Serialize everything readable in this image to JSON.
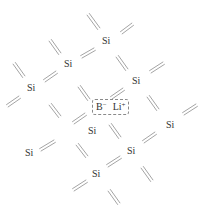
{
  "diagram": {
    "line_color": "#9a9a9a",
    "atoms": [
      {
        "label": "Si",
        "x": 102,
        "y": 36
      },
      {
        "label": "Si",
        "x": 64,
        "y": 59
      },
      {
        "label": "Si",
        "x": 27,
        "y": 83
      },
      {
        "label": "Si",
        "x": 132,
        "y": 76
      },
      {
        "label": "Si",
        "x": 88,
        "y": 126
      },
      {
        "label": "Si",
        "x": 25,
        "y": 148
      },
      {
        "label": "Si",
        "x": 166,
        "y": 120
      },
      {
        "label": "Si",
        "x": 127,
        "y": 146
      },
      {
        "label": "Si",
        "x": 92,
        "y": 169
      }
    ],
    "dopant": {
      "boron": "B",
      "boron_charge": "−",
      "lithium": "Li",
      "lithium_charge": "+",
      "x": 92,
      "y": 99
    },
    "bonds": [
      {
        "x1": 88,
        "y1": 14,
        "x2": 99,
        "y2": 29,
        "dir": "back"
      },
      {
        "x1": 121,
        "y1": 33,
        "x2": 133,
        "y2": 24,
        "dir": "fwd"
      },
      {
        "x1": 50,
        "y1": 40,
        "x2": 60,
        "y2": 54,
        "dir": "back"
      },
      {
        "x1": 81,
        "y1": 57,
        "x2": 95,
        "y2": 49,
        "dir": "fwd"
      },
      {
        "x1": 14,
        "y1": 63,
        "x2": 24,
        "y2": 77,
        "dir": "back"
      },
      {
        "x1": 44,
        "y1": 81,
        "x2": 57,
        "y2": 72,
        "dir": "fwd"
      },
      {
        "x1": 117,
        "y1": 56,
        "x2": 127,
        "y2": 70,
        "dir": "back"
      },
      {
        "x1": 150,
        "y1": 72,
        "x2": 164,
        "y2": 63,
        "dir": "fwd"
      },
      {
        "x1": 7,
        "y1": 106,
        "x2": 20,
        "y2": 97,
        "dir": "fwd"
      },
      {
        "x1": 50,
        "y1": 104,
        "x2": 60,
        "y2": 117,
        "dir": "back"
      },
      {
        "x1": 79,
        "y1": 86,
        "x2": 89,
        "y2": 100,
        "dir": "back"
      },
      {
        "x1": 73,
        "y1": 123,
        "x2": 86,
        "y2": 114,
        "dir": "fwd"
      },
      {
        "x1": 111,
        "y1": 98,
        "x2": 124,
        "y2": 89,
        "dir": "fwd"
      },
      {
        "x1": 148,
        "y1": 96,
        "x2": 158,
        "y2": 110,
        "dir": "back"
      },
      {
        "x1": 183,
        "y1": 114,
        "x2": 197,
        "y2": 105,
        "dir": "fwd"
      },
      {
        "x1": 40,
        "y1": 150,
        "x2": 55,
        "y2": 141,
        "dir": "fwd"
      },
      {
        "x1": 77,
        "y1": 144,
        "x2": 87,
        "y2": 157,
        "dir": "back"
      },
      {
        "x1": 110,
        "y1": 124,
        "x2": 120,
        "y2": 138,
        "dir": "back"
      },
      {
        "x1": 143,
        "y1": 142,
        "x2": 156,
        "y2": 133,
        "dir": "fwd"
      },
      {
        "x1": 107,
        "y1": 166,
        "x2": 121,
        "y2": 157,
        "dir": "fwd"
      },
      {
        "x1": 142,
        "y1": 167,
        "x2": 152,
        "y2": 181,
        "dir": "back"
      },
      {
        "x1": 73,
        "y1": 190,
        "x2": 87,
        "y2": 181,
        "dir": "fwd"
      },
      {
        "x1": 109,
        "y1": 190,
        "x2": 119,
        "y2": 204,
        "dir": "back"
      }
    ]
  }
}
